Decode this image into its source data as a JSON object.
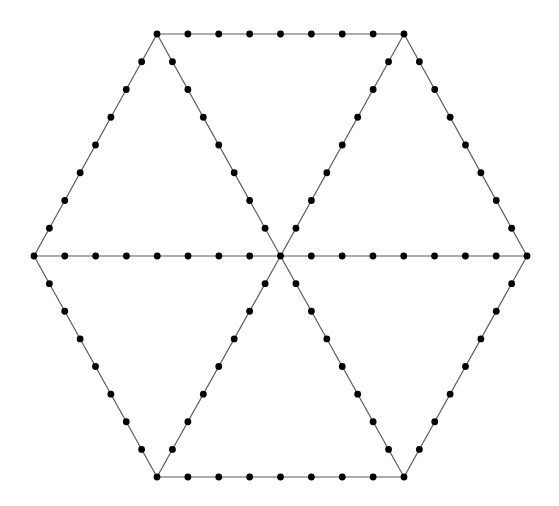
{
  "diagram": {
    "type": "subdivided-hexagon",
    "canvas": {
      "width": 559,
      "height": 506,
      "background": "#ffffff"
    },
    "style": {
      "line_color": "#5a5a5a",
      "line_width": 1.2,
      "dot_color": "#000000",
      "dot_radius": 3.4
    },
    "subdivisions_per_edge": 8,
    "vertices": {
      "center": [
        280.5,
        256
      ],
      "left": [
        34,
        256
      ],
      "right": [
        527,
        256
      ],
      "top_left": [
        157,
        34
      ],
      "top_right": [
        404,
        34
      ],
      "bottom_left": [
        157,
        477
      ],
      "bottom_right": [
        404,
        477
      ]
    },
    "edges": [
      {
        "name": "top-edge",
        "from": "top_left",
        "to": "top_right"
      },
      {
        "name": "upper-right-edge",
        "from": "top_right",
        "to": "right"
      },
      {
        "name": "lower-right-edge",
        "from": "right",
        "to": "bottom_right"
      },
      {
        "name": "bottom-edge",
        "from": "bottom_right",
        "to": "bottom_left"
      },
      {
        "name": "lower-left-edge",
        "from": "bottom_left",
        "to": "left"
      },
      {
        "name": "upper-left-edge",
        "from": "left",
        "to": "top_left"
      },
      {
        "name": "spoke-left",
        "from": "center",
        "to": "left"
      },
      {
        "name": "spoke-right",
        "from": "center",
        "to": "right"
      },
      {
        "name": "spoke-top-left",
        "from": "center",
        "to": "top_left"
      },
      {
        "name": "spoke-top-right",
        "from": "center",
        "to": "top_right"
      },
      {
        "name": "spoke-bottom-left",
        "from": "center",
        "to": "bottom_left"
      },
      {
        "name": "spoke-bottom-right",
        "from": "center",
        "to": "bottom_right"
      }
    ]
  }
}
